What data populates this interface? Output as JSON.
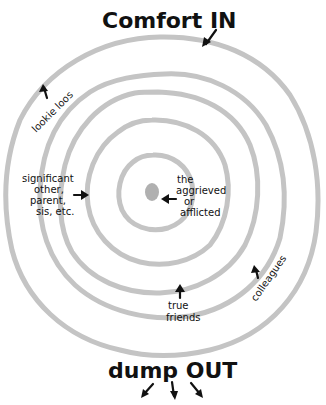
{
  "diagram": {
    "type": "concentric-rings",
    "title_top": "Comfort IN",
    "title_bottom": "dump OUT",
    "ring_color": "#c4c4c4",
    "ink_color": "#111111",
    "center_dot_color": "#b0b0b0",
    "rings": [
      {
        "level": 1,
        "label_lines": [
          "the",
          "aggrieved",
          "or",
          "afflicted"
        ]
      },
      {
        "level": 2,
        "label_lines": [
          "significant",
          "other,",
          "parent,",
          "sis, etc."
        ]
      },
      {
        "level": 3,
        "label_lines": [
          "true",
          "friends"
        ]
      },
      {
        "level": 4,
        "label_lines": [
          "colleagues"
        ]
      },
      {
        "level": 5,
        "label_lines": [
          "lookie loos"
        ]
      }
    ],
    "arrows": {
      "comfort_in": "inward",
      "dump_out": [
        "down-left",
        "down",
        "down-right"
      ]
    }
  }
}
